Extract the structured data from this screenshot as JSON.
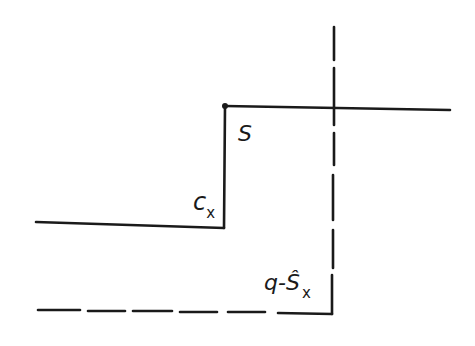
{
  "diagram": {
    "stroke_color": "#1a1a1a",
    "labels": {
      "s": "S",
      "c_main": "c",
      "c_sub": "x",
      "q_main": "q-Ŝ",
      "q_sub": "x"
    },
    "solid_lines": [
      {
        "name": "upper-level-line",
        "x1": 225,
        "y1": 106,
        "x2": 450,
        "y2": 110
      },
      {
        "name": "step-riser-line",
        "x1": 225,
        "y1": 106,
        "x2": 224,
        "y2": 228
      },
      {
        "name": "lower-level-line",
        "x1": 36,
        "y1": 222,
        "x2": 224,
        "y2": 228
      }
    ],
    "dashed_lines": [
      {
        "name": "vertical-dashed-line",
        "segments": [
          [
            334,
            27,
            334,
            60
          ],
          [
            334,
            68,
            334,
            125
          ],
          [
            334,
            133,
            334,
            165
          ],
          [
            333,
            175,
            333,
            220
          ],
          [
            333,
            230,
            333,
            268
          ],
          [
            332,
            275,
            332,
            314
          ]
        ]
      },
      {
        "name": "bottom-dashed-line",
        "segments": [
          [
            38,
            310,
            80,
            310
          ],
          [
            88,
            311,
            125,
            311
          ],
          [
            133,
            311,
            172,
            311
          ],
          [
            180,
            312,
            217,
            312
          ],
          [
            228,
            312,
            265,
            312
          ],
          [
            278,
            313,
            332,
            314
          ]
        ]
      }
    ],
    "point": {
      "name": "corner-dot",
      "cx": 225,
      "cy": 106,
      "r": 3
    }
  }
}
